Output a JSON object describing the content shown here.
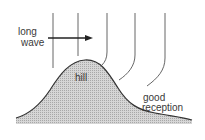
{
  "diagram": {
    "labels": {
      "long": "long",
      "wave": "wave",
      "hill": "hill",
      "good": "good",
      "reception": "reception"
    },
    "colors": {
      "line": "#555555",
      "hill_fill": "#c8c8c8",
      "hill_outline": "#333333",
      "text": "#3a3a3a",
      "background": "#ffffff"
    },
    "elements": {
      "wave_lines": 5,
      "arrow_direction": "right"
    }
  }
}
